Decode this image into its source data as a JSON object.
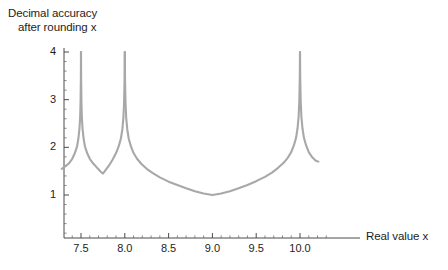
{
  "chart_data": {
    "type": "line",
    "title": "",
    "ylabel_line1": "Decimal accuracy",
    "ylabel_line2": "after rounding x",
    "xlabel": "Real value x",
    "xlim": [
      7.28,
      10.28
    ],
    "ylim": [
      0,
      4.25
    ],
    "x_ticks": [
      7.5,
      8.0,
      8.5,
      9.0,
      9.5,
      10.0
    ],
    "x_tick_labels": [
      "7.5",
      "8.0",
      "8.5",
      "9.0",
      "9.5",
      "10.0"
    ],
    "x_minor_step": 0.1,
    "y_ticks": [
      1,
      2,
      3,
      4
    ],
    "y_tick_labels": [
      "1",
      "2",
      "3",
      "4"
    ],
    "y_minor_step": 0.2,
    "grid": false,
    "legend": null,
    "series": [
      {
        "name": "decimal accuracy",
        "color": "#a8a8a8",
        "line_width": 2.1,
        "points": [
          [
            7.28,
            1.55
          ],
          [
            7.32,
            1.6
          ],
          [
            7.36,
            1.66
          ],
          [
            7.4,
            1.76
          ],
          [
            7.43,
            1.88
          ],
          [
            7.455,
            2.02
          ],
          [
            7.47,
            2.18
          ],
          [
            7.482,
            2.38
          ],
          [
            7.49,
            2.62
          ],
          [
            7.495,
            2.95
          ],
          [
            7.4985,
            3.45
          ],
          [
            7.4999,
            4.0
          ],
          [
            7.5001,
            4.0
          ],
          [
            7.5015,
            3.45
          ],
          [
            7.505,
            2.95
          ],
          [
            7.51,
            2.62
          ],
          [
            7.518,
            2.38
          ],
          [
            7.53,
            2.18
          ],
          [
            7.545,
            2.02
          ],
          [
            7.57,
            1.88
          ],
          [
            7.6,
            1.76
          ],
          [
            7.64,
            1.66
          ],
          [
            7.68,
            1.58
          ],
          [
            7.72,
            1.5
          ],
          [
            7.749,
            1.45
          ],
          [
            7.751,
            1.45
          ],
          [
            7.78,
            1.52
          ],
          [
            7.82,
            1.62
          ],
          [
            7.86,
            1.74
          ],
          [
            7.9,
            1.88
          ],
          [
            7.93,
            2.02
          ],
          [
            7.955,
            2.18
          ],
          [
            7.972,
            2.38
          ],
          [
            7.984,
            2.62
          ],
          [
            7.992,
            2.95
          ],
          [
            7.9975,
            3.45
          ],
          [
            7.9999,
            4.0
          ],
          [
            8.0001,
            4.0
          ],
          [
            8.0025,
            3.45
          ],
          [
            8.008,
            2.95
          ],
          [
            8.016,
            2.62
          ],
          [
            8.028,
            2.38
          ],
          [
            8.045,
            2.18
          ],
          [
            8.07,
            2.02
          ],
          [
            8.1,
            1.88
          ],
          [
            8.14,
            1.76
          ],
          [
            8.19,
            1.65
          ],
          [
            8.25,
            1.55
          ],
          [
            8.32,
            1.46
          ],
          [
            8.4,
            1.37
          ],
          [
            8.5,
            1.28
          ],
          [
            8.6,
            1.21
          ],
          [
            8.7,
            1.14
          ],
          [
            8.8,
            1.08
          ],
          [
            8.9,
            1.03
          ],
          [
            8.999,
            1.0
          ],
          [
            9.001,
            1.0
          ],
          [
            9.1,
            1.03
          ],
          [
            9.2,
            1.08
          ],
          [
            9.3,
            1.14
          ],
          [
            9.4,
            1.21
          ],
          [
            9.5,
            1.29
          ],
          [
            9.6,
            1.38
          ],
          [
            9.68,
            1.47
          ],
          [
            9.75,
            1.57
          ],
          [
            9.81,
            1.67
          ],
          [
            9.86,
            1.78
          ],
          [
            9.9,
            1.9
          ],
          [
            9.93,
            2.04
          ],
          [
            9.955,
            2.2
          ],
          [
            9.972,
            2.4
          ],
          [
            9.984,
            2.64
          ],
          [
            9.992,
            2.97
          ],
          [
            9.9975,
            3.46
          ],
          [
            9.9999,
            4.0
          ],
          [
            10.0001,
            4.0
          ],
          [
            10.0025,
            3.46
          ],
          [
            10.008,
            2.97
          ],
          [
            10.016,
            2.64
          ],
          [
            10.028,
            2.4
          ],
          [
            10.045,
            2.2
          ],
          [
            10.07,
            2.04
          ],
          [
            10.1,
            1.9
          ],
          [
            10.14,
            1.79
          ],
          [
            10.18,
            1.72
          ],
          [
            10.21,
            1.7
          ]
        ],
        "asymptotes": [
          7.5,
          8.0,
          10.0
        ],
        "minima": [
          [
            7.75,
            1.45
          ],
          [
            9.0,
            1.0
          ]
        ]
      }
    ]
  },
  "chart": {
    "ytitle_line1": "Decimal accuracy",
    "ytitle_line2": "after rounding x",
    "xtitle": "Real value x",
    "x_tick_labels": [
      "7.5",
      "8.0",
      "8.5",
      "9.0",
      "9.5",
      "10.0"
    ],
    "y_tick_labels": [
      "1",
      "2",
      "3",
      "4"
    ]
  },
  "colors": {
    "curve": "#a8a8a8",
    "axis": "#4a4a4a",
    "text": "#1d1d1d",
    "background": "#ffffff"
  }
}
